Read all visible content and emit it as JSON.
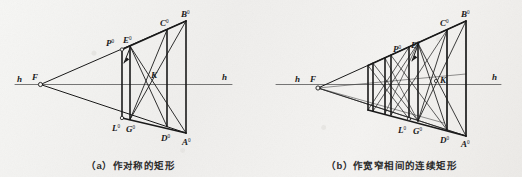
{
  "figure": {
    "background_color": "#f2f2f0",
    "ink_color": "#1a1a1a",
    "panels": [
      {
        "id": "a",
        "caption": "（a）作对称的矩形",
        "horizon_label_left": "h",
        "horizon_label_right": "h",
        "vanishing_point_label": "F",
        "center_point_label": "K",
        "points": [
          {
            "name": "P",
            "sup": "0"
          },
          {
            "name": "E",
            "sup": "0"
          },
          {
            "name": "C",
            "sup": "0"
          },
          {
            "name": "B",
            "sup": "0"
          },
          {
            "name": "L",
            "sup": "0"
          },
          {
            "name": "G",
            "sup": "0"
          },
          {
            "name": "D",
            "sup": "0"
          },
          {
            "name": "A",
            "sup": "0"
          }
        ]
      },
      {
        "id": "b",
        "caption": "（b）作宽窄相间的连续矩形",
        "horizon_label_left": "h",
        "horizon_label_right": "h",
        "vanishing_point_label": "F",
        "center_point_label": "K",
        "points": [
          {
            "name": "P",
            "sup": "0"
          },
          {
            "name": "E",
            "sup": "0"
          },
          {
            "name": "C",
            "sup": "0"
          },
          {
            "name": "B",
            "sup": "0"
          },
          {
            "name": "L",
            "sup": "0"
          },
          {
            "name": "G",
            "sup": "0"
          },
          {
            "name": "D",
            "sup": "0"
          },
          {
            "name": "A",
            "sup": "0"
          }
        ]
      }
    ]
  }
}
